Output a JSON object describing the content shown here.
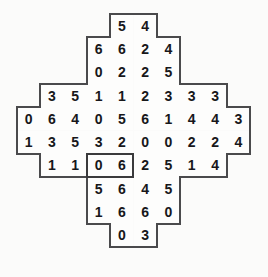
{
  "puzzle": {
    "title": "domino-number-grid",
    "shape": "octagonal-cross",
    "rows": 11,
    "columns": 10,
    "cell_size": 23.3,
    "origin_x": 17,
    "origin_y": 14,
    "background_color": "#fbfbfa",
    "cell_color": "#fdfdfc",
    "border_color": "#4a4a4c",
    "digit_color": "#17171a",
    "highlight": {
      "label": "selected-domino",
      "row": 6,
      "col_start": 3,
      "col_end": 4,
      "values": "3 2",
      "border_color": "#3a3a3c"
    },
    "grid": [
      {
        "indent": 4,
        "values": [
          "5",
          "4"
        ]
      },
      {
        "indent": 3,
        "values": [
          "6",
          "6",
          "2",
          "4"
        ]
      },
      {
        "indent": 3,
        "values": [
          "0",
          "2",
          "2",
          "5"
        ]
      },
      {
        "indent": 1,
        "values": [
          "3",
          "5",
          "1",
          "1",
          "2",
          "3",
          "3",
          "3"
        ]
      },
      {
        "indent": 0,
        "values": [
          "0",
          "6",
          "4",
          "0",
          "5",
          "6",
          "1",
          "4",
          "4",
          "3"
        ]
      },
      {
        "indent": 0,
        "values": [
          "1",
          "3",
          "5",
          "3",
          "2",
          "0",
          "0",
          "2",
          "2",
          "4"
        ]
      },
      {
        "indent": 1,
        "values": [
          "1",
          "1",
          "0",
          "6",
          "2",
          "5",
          "1",
          "4"
        ]
      },
      {
        "indent": 3,
        "values": [
          "5",
          "6",
          "4",
          "5"
        ]
      },
      {
        "indent": 3,
        "values": [
          "1",
          "6",
          "6",
          "0"
        ]
      },
      {
        "indent": 4,
        "values": [
          "0",
          "3"
        ]
      }
    ]
  }
}
